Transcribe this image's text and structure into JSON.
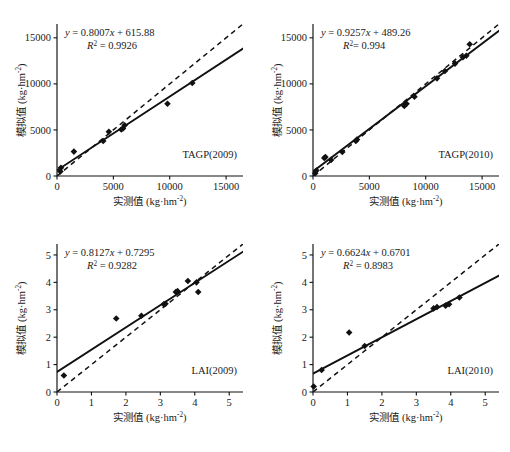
{
  "figure": {
    "name": "regression-scatter-figure",
    "panel_count": 4,
    "axis_title_x": "实测值 (kg·hm",
    "axis_title_x_sup": "-2",
    "axis_title_x_tail": ")",
    "axis_title_y": "模拟值 (kg·hm",
    "axis_title_y_sup": "-2",
    "axis_title_y_tail": ")",
    "colors": {
      "line": "#111111",
      "point": "#111111",
      "text": "#1a1a1a",
      "background": "#ffffff"
    }
  },
  "chart_data": [
    {
      "type": "scatter",
      "id": "tagp-2009",
      "title": "TAGP(2009)",
      "xlabel": "实测值 (kg·hm-2)",
      "ylabel": "模拟值 (kg·hm-2)",
      "equation": "y = 0.8007x + 615.88",
      "equation_slope": 0.8007,
      "equation_intercept": 615.88,
      "r2_label": "R2 = 0.9926",
      "r2": 0.9926,
      "xlim": [
        0,
        16500
      ],
      "ylim": [
        0,
        16500
      ],
      "xticks": [
        0,
        5000,
        10000,
        15000
      ],
      "yticks": [
        0,
        5000,
        10000,
        15000
      ],
      "xticklabels": [
        "0",
        "5000",
        "10000",
        "15000"
      ],
      "yticklabels": [
        "0",
        "5000",
        "10000",
        "15000"
      ],
      "grid": false,
      "legend": "none",
      "reference_line": {
        "slope": 1,
        "intercept": 0,
        "style": "dashed"
      },
      "fit_line": {
        "slope": 0.8007,
        "intercept": 615.88,
        "style": "solid"
      },
      "points": [
        {
          "x": 300,
          "y": 500
        },
        {
          "x": 350,
          "y": 900
        },
        {
          "x": 1500,
          "y": 2650
        },
        {
          "x": 4100,
          "y": 3800
        },
        {
          "x": 4600,
          "y": 4800
        },
        {
          "x": 5700,
          "y": 5050
        },
        {
          "x": 5850,
          "y": 5150
        },
        {
          "x": 6000,
          "y": 5500
        },
        {
          "x": 9800,
          "y": 7850
        },
        {
          "x": 12000,
          "y": 10100
        }
      ]
    },
    {
      "type": "scatter",
      "id": "tagp-2010",
      "title": "TAGP(2010)",
      "xlabel": "实测值 (kg·hm-2)",
      "ylabel": "模拟值 (kg·hm-2)",
      "equation": "y = 0.9257x + 489.26",
      "equation_slope": 0.9257,
      "equation_intercept": 489.26,
      "r2_label": "R2= 0.994",
      "r2": 0.994,
      "xlim": [
        0,
        16500
      ],
      "ylim": [
        0,
        16500
      ],
      "xticks": [
        0,
        5000,
        10000,
        15000
      ],
      "yticks": [
        0,
        5000,
        10000,
        15000
      ],
      "xticklabels": [
        "0",
        "5000",
        "10000",
        "15000"
      ],
      "yticklabels": [
        "0",
        "5000",
        "10000",
        "15000"
      ],
      "grid": false,
      "legend": "none",
      "reference_line": {
        "slope": 1,
        "intercept": 0,
        "style": "dashed"
      },
      "fit_line": {
        "slope": 0.9257,
        "intercept": 489.26,
        "style": "solid"
      },
      "points": [
        {
          "x": 200,
          "y": 300
        },
        {
          "x": 300,
          "y": 600
        },
        {
          "x": 1000,
          "y": 1950
        },
        {
          "x": 1100,
          "y": 2050
        },
        {
          "x": 1600,
          "y": 1750
        },
        {
          "x": 2600,
          "y": 2600
        },
        {
          "x": 3800,
          "y": 3800
        },
        {
          "x": 3900,
          "y": 3950
        },
        {
          "x": 8100,
          "y": 7600
        },
        {
          "x": 8300,
          "y": 7850
        },
        {
          "x": 9000,
          "y": 8600
        },
        {
          "x": 11000,
          "y": 10600
        },
        {
          "x": 11700,
          "y": 11400
        },
        {
          "x": 12600,
          "y": 12200
        },
        {
          "x": 13300,
          "y": 12900
        },
        {
          "x": 13600,
          "y": 13050
        },
        {
          "x": 13900,
          "y": 14300
        }
      ]
    },
    {
      "type": "scatter",
      "id": "lai-2009",
      "title": "LAI(2009)",
      "xlabel": "实测值 (kg·hm-2)",
      "ylabel": "模拟值 (kg·hm-2)",
      "equation": "y = 0.8127x + 0.7295",
      "equation_slope": 0.8127,
      "equation_intercept": 0.7295,
      "r2_label": "R2 = 0.9282",
      "r2": 0.9282,
      "xlim": [
        0,
        5.4
      ],
      "ylim": [
        0,
        5.4
      ],
      "xticks": [
        0,
        1,
        2,
        3,
        4,
        5
      ],
      "yticks": [
        0,
        1,
        2,
        3,
        4,
        5
      ],
      "xticklabels": [
        "0",
        "1",
        "2",
        "3",
        "4",
        "5"
      ],
      "yticklabels": [
        "0",
        "1",
        "2",
        "3",
        "4",
        "5"
      ],
      "grid": false,
      "legend": "none",
      "reference_line": {
        "slope": 1,
        "intercept": 0,
        "style": "dashed"
      },
      "fit_line": {
        "slope": 0.8127,
        "intercept": 0.7295,
        "style": "solid"
      },
      "points": [
        {
          "x": 0.2,
          "y": 0.6
        },
        {
          "x": 1.72,
          "y": 2.68
        },
        {
          "x": 2.45,
          "y": 2.78
        },
        {
          "x": 3.1,
          "y": 3.2
        },
        {
          "x": 3.15,
          "y": 3.22
        },
        {
          "x": 3.45,
          "y": 3.65
        },
        {
          "x": 3.5,
          "y": 3.68
        },
        {
          "x": 3.8,
          "y": 4.05
        },
        {
          "x": 4.05,
          "y": 4.0
        },
        {
          "x": 4.1,
          "y": 3.65
        }
      ]
    },
    {
      "type": "scatter",
      "id": "lai-2010",
      "title": "LAI(2010)",
      "xlabel": "实测值 (kg·hm-2)",
      "ylabel": "模拟值 (kg·hm-2)",
      "equation": "y = 0.6624x + 0.6701",
      "equation_slope": 0.6624,
      "equation_intercept": 0.6701,
      "r2_label": "R2 = 0.8983",
      "r2": 0.8983,
      "xlim": [
        0,
        5.4
      ],
      "ylim": [
        0,
        5.4
      ],
      "xticks": [
        0,
        1,
        2,
        3,
        4,
        5
      ],
      "yticks": [
        0,
        1,
        2,
        3,
        4,
        5
      ],
      "xticklabels": [
        "0",
        "1",
        "2",
        "3",
        "4",
        "5"
      ],
      "yticklabels": [
        "0",
        "1",
        "2",
        "3",
        "4",
        "5"
      ],
      "grid": false,
      "legend": "none",
      "reference_line": {
        "slope": 1,
        "intercept": 0,
        "style": "dashed"
      },
      "fit_line": {
        "slope": 0.6624,
        "intercept": 0.6701,
        "style": "solid"
      },
      "points": [
        {
          "x": 0.02,
          "y": 0.2
        },
        {
          "x": 0.25,
          "y": 0.8
        },
        {
          "x": 1.05,
          "y": 2.17
        },
        {
          "x": 1.5,
          "y": 1.68
        },
        {
          "x": 3.5,
          "y": 3.05
        },
        {
          "x": 3.6,
          "y": 3.1
        },
        {
          "x": 3.85,
          "y": 3.15
        },
        {
          "x": 3.95,
          "y": 3.2
        },
        {
          "x": 4.25,
          "y": 3.45
        }
      ]
    }
  ]
}
